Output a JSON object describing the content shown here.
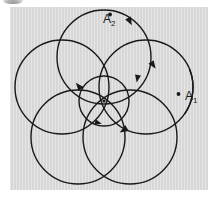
{
  "figure": {
    "kind": "epicycle-orbit-diagram",
    "title": "",
    "background_color": "#d7d7d7",
    "page_color": "#ffffff",
    "stroke_color": "#1a1a1a",
    "panel": {
      "x": 10,
      "y": 7,
      "width": 198,
      "height": 183
    },
    "labels": [
      {
        "name": "label-a1",
        "text": "A",
        "subscript": "1",
        "x": 185,
        "y": 90
      },
      {
        "name": "label-a2",
        "text": "A",
        "subscript": "2",
        "x": 103,
        "y": 13
      }
    ],
    "center": {
      "x": 104,
      "y": 101
    },
    "center_dot": {
      "x": 104,
      "y": 101,
      "r": 1.6
    },
    "inner_circle": {
      "cx": 104,
      "cy": 101,
      "r": 25,
      "stroke_width": 1.4
    },
    "outer_circles": [
      {
        "cx": 104,
        "cy": 57,
        "r": 47,
        "stroke_width": 1.4
      },
      {
        "cx": 146,
        "cy": 87,
        "r": 47,
        "stroke_width": 1.4
      },
      {
        "cx": 130,
        "cy": 137,
        "r": 47,
        "stroke_width": 1.4
      },
      {
        "cx": 78,
        "cy": 137,
        "r": 47,
        "stroke_width": 1.4
      },
      {
        "cx": 62,
        "cy": 87,
        "r": 47,
        "stroke_width": 1.4
      }
    ],
    "open_arc_a1": {
      "cx": 146,
      "cy": 87,
      "r": 47,
      "start_deg": -22,
      "end_deg": 34,
      "stroke_width": 1.4
    },
    "tick_markers": [
      {
        "x": 110,
        "y": 14
      },
      {
        "x": 178,
        "y": 94
      }
    ],
    "arrowheads": [
      {
        "x": 128,
        "y": 18,
        "angle_deg": 62
      },
      {
        "x": 151,
        "y": 62,
        "angle_deg": 55
      },
      {
        "x": 138,
        "y": 75,
        "angle_deg": 100
      },
      {
        "x": 127,
        "y": 128,
        "angle_deg": 148
      },
      {
        "x": 81,
        "y": 89,
        "angle_deg": 230
      },
      {
        "x": 95,
        "y": 122,
        "angle_deg": 15
      }
    ],
    "circle_count": 5,
    "has_inner_circle": true,
    "has_center_dot": true
  }
}
